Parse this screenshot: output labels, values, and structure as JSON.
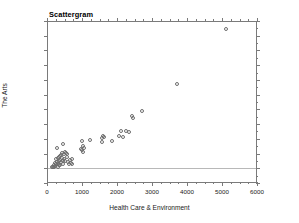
{
  "chart_data": {
    "type": "scatter",
    "title": "Scattergram",
    "xlabel": "Health Care & Environment",
    "ylabel": "The Arts",
    "xlim": [
      0,
      6000
    ],
    "ylim": [
      -2500,
      25000
    ],
    "xticks": [
      0,
      1000,
      2000,
      3000,
      4000,
      5000,
      6000
    ],
    "yticks": [
      -2500,
      0,
      2500,
      5000,
      7500,
      10000,
      12500,
      15000,
      17500,
      20000,
      22500,
      25000
    ],
    "xtick_labels": [
      "0",
      "1000",
      "2000",
      "3000",
      "4000",
      "5000",
      "6000"
    ],
    "ytick_labels": [
      "-2500",
      "0",
      "2500",
      "5000",
      "7500",
      "10000",
      "12500",
      "15000",
      "17500",
      "20000",
      "22500",
      "25000"
    ],
    "grid": false,
    "legend": null,
    "marker": "open-circle",
    "marker_color": "#6e6e6e",
    "reference_line_y": 0,
    "series": [
      {
        "name": "observations",
        "points": [
          [
            150,
            300
          ],
          [
            180,
            250
          ],
          [
            200,
            600
          ],
          [
            210,
            180
          ],
          [
            230,
            900
          ],
          [
            240,
            420
          ],
          [
            255,
            1500
          ],
          [
            265,
            700
          ],
          [
            280,
            1100
          ],
          [
            290,
            3500
          ],
          [
            300,
            250
          ],
          [
            310,
            1700
          ],
          [
            320,
            800
          ],
          [
            330,
            1950
          ],
          [
            340,
            1250
          ],
          [
            350,
            500
          ],
          [
            360,
            2100
          ],
          [
            370,
            1400
          ],
          [
            385,
            600
          ],
          [
            395,
            2300
          ],
          [
            410,
            1000
          ],
          [
            420,
            1800
          ],
          [
            435,
            2600
          ],
          [
            445,
            1300
          ],
          [
            460,
            4150
          ],
          [
            470,
            700
          ],
          [
            480,
            2450
          ],
          [
            495,
            1600
          ],
          [
            510,
            2800
          ],
          [
            520,
            1150
          ],
          [
            540,
            2550
          ],
          [
            560,
            1900
          ],
          [
            580,
            2350
          ],
          [
            600,
            1050
          ],
          [
            620,
            750
          ],
          [
            650,
            1450
          ],
          [
            680,
            950
          ],
          [
            700,
            1500
          ],
          [
            720,
            800
          ],
          [
            980,
            3300
          ],
          [
            1000,
            4550
          ],
          [
            1010,
            3050
          ],
          [
            1030,
            3700
          ],
          [
            1040,
            2750
          ],
          [
            1060,
            3400
          ],
          [
            1230,
            4850
          ],
          [
            1560,
            5150
          ],
          [
            1580,
            4500
          ],
          [
            1600,
            5400
          ],
          [
            1620,
            5300
          ],
          [
            1850,
            4550
          ],
          [
            2050,
            5400
          ],
          [
            2120,
            6350
          ],
          [
            2180,
            5250
          ],
          [
            2250,
            6300
          ],
          [
            2350,
            6200
          ],
          [
            2420,
            8800
          ],
          [
            2470,
            8500
          ],
          [
            2720,
            9650
          ],
          [
            3700,
            14300
          ],
          [
            5100,
            23700
          ]
        ]
      }
    ]
  }
}
